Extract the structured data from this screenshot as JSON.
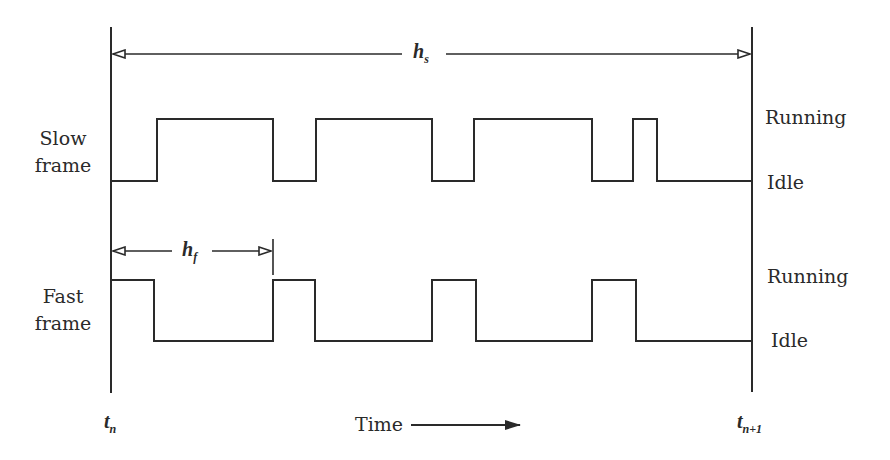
{
  "diagram": {
    "type": "timing-diagram",
    "colors": {
      "line": "#2a2a2a",
      "background": "#ffffff"
    },
    "boundaries": {
      "start": {
        "label": "t",
        "subscript": "n"
      },
      "end": {
        "label": "t",
        "subscript": "n+1"
      }
    },
    "slow_period": {
      "label": "h",
      "subscript": "s"
    },
    "fast_period": {
      "label": "h",
      "subscript": "f"
    },
    "rows": [
      {
        "name": "slow",
        "label_line1": "Slow",
        "label_line2": "frame",
        "state_high": "Running",
        "state_low": "Idle",
        "transitions_x": [
          157,
          273,
          316,
          432,
          474,
          592,
          633,
          657
        ],
        "initial_state": "Idle"
      },
      {
        "name": "fast",
        "label_line1": "Fast",
        "label_line2": "frame",
        "state_high": "Running",
        "state_low": "Idle",
        "transitions_x": [
          154,
          273,
          315,
          432,
          476,
          592,
          636
        ],
        "initial_state": "Running"
      }
    ],
    "time_axis": {
      "label": "Time"
    }
  }
}
